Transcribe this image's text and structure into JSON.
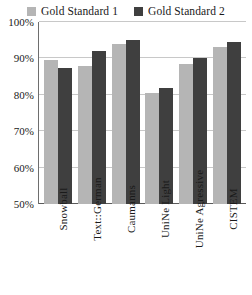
{
  "chart_data": {
    "type": "bar",
    "title": "",
    "subtitle": "",
    "xlabel": "",
    "ylabel": "",
    "categories": [
      "Snowball",
      "Text::German",
      "Caumanns",
      "UniNe Light",
      "UniNe Agressive",
      "CISTEM"
    ],
    "series": [
      {
        "name": "Gold Standard 1",
        "color": "#b5b5b5",
        "values": [
          89.5,
          88.0,
          94.0,
          80.5,
          88.5,
          93.0
        ]
      },
      {
        "name": "Gold Standard 2",
        "color": "#3f3f3f",
        "values": [
          87.5,
          92.0,
          95.0,
          82.0,
          90.0,
          94.5
        ]
      }
    ],
    "ylim": [
      50,
      100
    ],
    "yticks": [
      50,
      60,
      70,
      80,
      90,
      100
    ],
    "ytick_labels": [
      "50%",
      "60%",
      "70%",
      "80%",
      "90%",
      "100%"
    ],
    "grid": true,
    "legend_position": "top"
  },
  "legend": {
    "entries": [
      {
        "label": "Gold Standard 1",
        "swatch_name": "legend-swatch-gold-standard-1"
      },
      {
        "label": "Gold Standard 2",
        "swatch_name": "legend-swatch-gold-standard-2"
      }
    ]
  },
  "colors": {
    "series_1": "#b5b5b5",
    "series_2": "#3f3f3f",
    "gridline": "#c8c8c8",
    "axis": "#5a5a5a",
    "background": "#ffffff"
  }
}
